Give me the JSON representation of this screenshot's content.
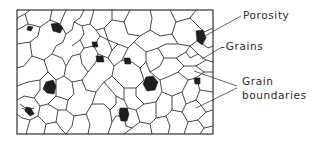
{
  "figure": {
    "type": "microstructure-schematic",
    "colors": {
      "background": "#ffffff",
      "lines": "#333333",
      "pores": "#1e1e1e"
    }
  },
  "labels": [
    {
      "id": "porosity",
      "text": "Porosity"
    },
    {
      "id": "grains",
      "text": "-Grains"
    },
    {
      "id": "grain_boundaries_line1",
      "text": "Grain"
    },
    {
      "id": "grain_boundaries_line2",
      "text": "boundaries"
    }
  ]
}
